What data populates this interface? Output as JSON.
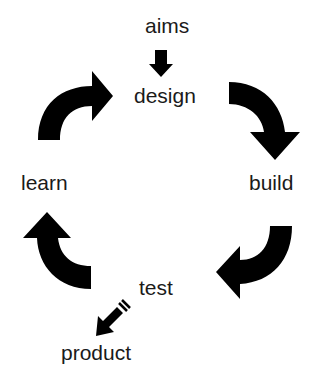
{
  "diagram": {
    "type": "cycle",
    "nodes": {
      "aims": "aims",
      "design": "design",
      "build": "build",
      "test": "test",
      "learn": "learn",
      "product": "product"
    },
    "cycle_order": [
      "design",
      "build",
      "test",
      "learn"
    ],
    "edges": [
      {
        "from": "aims",
        "to": "design",
        "icon": "arrow-down-icon"
      },
      {
        "from": "design",
        "to": "build",
        "icon": "curved-arrow-icon"
      },
      {
        "from": "build",
        "to": "test",
        "icon": "curved-arrow-icon"
      },
      {
        "from": "test",
        "to": "learn",
        "icon": "curved-arrow-icon"
      },
      {
        "from": "learn",
        "to": "design",
        "icon": "curved-arrow-icon"
      },
      {
        "from": "test",
        "to": "product",
        "icon": "arrow-icon"
      }
    ],
    "colors": {
      "arrow": "#000000",
      "text": "#1a1a1a",
      "background": "#ffffff"
    }
  }
}
